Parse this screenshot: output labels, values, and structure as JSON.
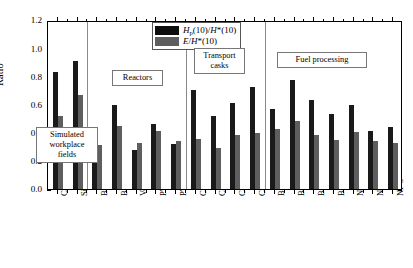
{
  "chart_data": {
    "type": "bar",
    "title": "",
    "xlabel": "",
    "ylabel": "Ratio",
    "ylim": [
      0.0,
      1.2
    ],
    "ytick_labels": [
      "0.0",
      "0.2",
      "0.4",
      "0.6",
      "0.8",
      "1.0",
      "1.2"
    ],
    "ytick_values": [
      0.0,
      0.2,
      0.4,
      0.6,
      0.8,
      1.0,
      1.2
    ],
    "grid": false,
    "legend_position": "top-center",
    "categories": [
      "Canel",
      "Sigma",
      "BWR SAR",
      "BWR T",
      "Venus F",
      "PWR L",
      "PWR A",
      "Cask NTL M",
      "Cask NTL S",
      "Cask TN N",
      "Cask TN D",
      "BN 1",
      "BN 2A",
      "BN 2B",
      "BN 3",
      "NF 1",
      "NF 2",
      "NF 3"
    ],
    "series": [
      {
        "name": "Hp(10)/H*(10)",
        "color": "#1a1a1a",
        "values": [
          0.83,
          0.91,
          0.215,
          0.6,
          0.28,
          0.465,
          0.32,
          0.7,
          0.52,
          0.61,
          0.725,
          0.565,
          0.775,
          0.635,
          0.535,
          0.595,
          0.415,
          0.44
        ]
      },
      {
        "name": "E/H*(10)",
        "color": "#5e5e5e",
        "values": [
          0.52,
          0.67,
          0.315,
          0.445,
          0.325,
          0.415,
          0.34,
          0.355,
          0.29,
          0.385,
          0.4,
          0.425,
          0.48,
          0.385,
          0.35,
          0.405,
          0.34,
          0.33
        ]
      }
    ],
    "group_annotations": [
      {
        "label": "Simulated\nworkplace\nfields",
        "categories": [
          "Canel",
          "Sigma"
        ]
      },
      {
        "label": "Reactors",
        "categories": [
          "BWR SAR",
          "BWR T",
          "Venus F",
          "PWR L",
          "PWR A"
        ]
      },
      {
        "label": "Transport\ncasks",
        "categories": [
          "Cask NTL M",
          "Cask NTL S",
          "Cask TN N",
          "Cask TN D"
        ]
      },
      {
        "label": "Fuel processing",
        "categories": [
          "BN 1",
          "BN 2A",
          "BN 2B",
          "BN 3",
          "NF 1",
          "NF 2",
          "NF 3"
        ]
      }
    ],
    "group_separators_after": [
      "Sigma",
      "PWR A",
      "Cask TN D"
    ]
  },
  "legend": {
    "entries": [
      {
        "label_html": "<i>H</i><sub>p</sub>(10)/<i>H</i>*(10)",
        "color": "#0d0d0d"
      },
      {
        "label_html": "<i>E</i>/<i>H</i>*(10)",
        "color": "#5e5e5e"
      }
    ]
  },
  "axis": {
    "y_title": "Ratio"
  }
}
